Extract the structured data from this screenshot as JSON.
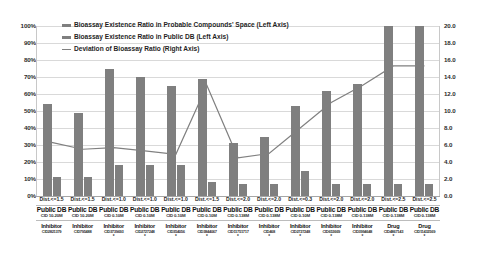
{
  "chart_data": {
    "type": "bar",
    "title": "",
    "xlabel": "",
    "ylabel": "",
    "ylim": [
      0,
      100
    ],
    "y2lim": [
      0,
      20
    ],
    "grid": true,
    "legend_position": "top-left",
    "categories": [
      "Dist.<=1.5",
      "Dist.<=1.5",
      "Dist.<=1.0",
      "Dist.<=1.0",
      "Dist.<=1.5",
      "Dist.<=2.0",
      "Dist.<=2.0",
      "Dist.<=2.0",
      "Dist.<=0.3",
      "Dist.<=2.0",
      "Dist.<=2.0",
      "Dist.<=2.5",
      "Dist.<=2.5"
    ],
    "series": [
      {
        "name": "Bioassay Existence Ratio in Probable Compounds' Space (Left Axis)",
        "axis": "left",
        "type": "bar",
        "color": "#7f7f7f",
        "values": [
          54,
          49,
          75,
          70,
          65,
          69,
          31,
          35,
          53,
          62,
          66,
          100,
          100
        ]
      },
      {
        "name": "Bioassay Existence Ratio in Public DB (Left Axis)",
        "axis": "left",
        "type": "bar",
        "color": "#7f7f7f",
        "values": [
          11,
          11,
          18,
          18,
          18,
          8,
          7,
          7,
          15,
          7,
          7,
          7,
          7
        ]
      },
      {
        "name": "Deviation of Bioassay Ratio (Right Axis)",
        "axis": "right",
        "type": "line",
        "color": "#808080",
        "values": [
          6.3,
          5.5,
          5.7,
          5.3,
          4.9,
          13.0,
          4.5,
          5.0,
          8.0,
          11.0,
          13.0,
          15.3,
          15.3
        ]
      }
    ],
    "y_left_ticks": [
      "0%",
      "10%",
      "20%",
      "30%",
      "40%",
      "50%",
      "60%",
      "70%",
      "80%",
      "90%",
      "100%"
    ],
    "y_right_ticks": [
      "0.0",
      "2.0",
      "4.0",
      "6.0",
      "8.0",
      "10.0",
      "12.0",
      "14.0",
      "16.0",
      "18.0",
      "20.0"
    ],
    "x_groups": [
      {
        "dist": "Dist.<=1.5",
        "db": "Public DB",
        "cid_range": "CID 10-20M",
        "target": "Inhibitor",
        "target_cid": "CID2821379",
        "marker": ""
      },
      {
        "dist": "Dist.<=1.5",
        "db": "Public DB",
        "cid_range": "CID 10-20M",
        "target": "Inhibitor",
        "target_cid": "CID795488",
        "marker": ""
      },
      {
        "dist": "Dist.<=1.0",
        "db": "Public DB",
        "cid_range": "CID 0-10M",
        "target": "Inhibitor",
        "target_cid": "CID3739693",
        "marker": "*"
      },
      {
        "dist": "Dist.<=1.0",
        "db": "Public DB",
        "cid_range": "CID 0-10M",
        "target": "Inhibitor",
        "target_cid": "CID2727248",
        "marker": "*"
      },
      {
        "dist": "Dist.<=1.0",
        "db": "Public DB",
        "cid_range": "CID 0-10M",
        "target": "Inhibitor",
        "target_cid": "CID354056",
        "marker": "*"
      },
      {
        "dist": "Dist.<=1.5",
        "db": "Public DB",
        "cid_range": "CID 0-10M",
        "target": "Inhibitor",
        "target_cid": "CID3844067",
        "marker": "*"
      },
      {
        "dist": "Dist.<=2.0",
        "db": "Public DB",
        "cid_range": "CID 0-138M",
        "target": "Inhibitor",
        "target_cid": "CID11751717",
        "marker": "*"
      },
      {
        "dist": "Dist.<=2.0",
        "db": "Public DB",
        "cid_range": "CID 0-138M",
        "target": "Inhibitor",
        "target_cid": "CID468",
        "marker": "*"
      },
      {
        "dist": "Dist.<=0.3",
        "db": "Public DB",
        "cid_range": "CID 0-10M",
        "target": "Inhibitor",
        "target_cid": "CID2727248",
        "marker": "*"
      },
      {
        "dist": "Dist.<=2.0",
        "db": "Public DB",
        "cid_range": "CID 0-138M",
        "target": "Inhibitor",
        "target_cid": "CID653669",
        "marker": "*"
      },
      {
        "dist": "Dist.<=2.0",
        "db": "Public DB",
        "cid_range": "CID 0-138M",
        "target": "Inhibitor",
        "target_cid": "CID3994648",
        "marker": "*"
      },
      {
        "dist": "Dist.<=2.5",
        "db": "Public DB",
        "cid_range": "CID 0-138M",
        "target": "Drug",
        "target_cid": "CID4867143",
        "marker": "*"
      },
      {
        "dist": "Dist.<=2.5",
        "db": "Public DB",
        "cid_range": "CID 0-138M",
        "target": "Drug",
        "target_cid": "CID11432569",
        "marker": "*"
      }
    ]
  },
  "legend": {
    "items": [
      {
        "label": "Bioassay Existence Ratio in Probable Compounds' Space (Left Axis)",
        "marker": "bar-swatch"
      },
      {
        "label": "Bioassay Existence Ratio in Public DB (Left Axis)",
        "marker": "bar-swatch"
      },
      {
        "label": "Deviation of Bioassay Ratio (Right Axis)",
        "marker": "line-swatch"
      }
    ]
  },
  "colors": {
    "bar": "#7f7f7f",
    "line": "#808080",
    "grid": "#d9d9d9",
    "background": "#ffffff"
  }
}
